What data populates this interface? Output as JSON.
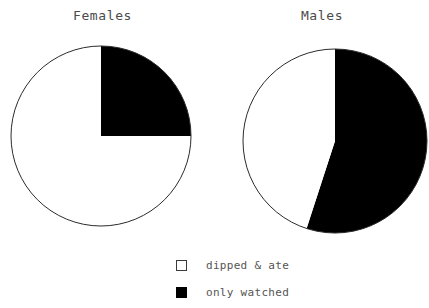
{
  "chart_data": [
    {
      "type": "pie",
      "title": "Females",
      "categories": [
        "dipped & ate",
        "only watched"
      ],
      "values": [
        75,
        25
      ],
      "colors": [
        "#ffffff",
        "#000000"
      ],
      "start_angle_deg": 0,
      "direction": "clockwise",
      "units": "percent",
      "grid": false,
      "legend_position": "bottom-center",
      "center": [
        101,
        136
      ],
      "radius": 90
    },
    {
      "type": "pie",
      "title": "Males",
      "categories": [
        "dipped & ate",
        "only watched"
      ],
      "values": [
        45,
        55
      ],
      "colors": [
        "#ffffff",
        "#000000"
      ],
      "start_angle_deg": 0,
      "direction": "clockwise",
      "units": "percent",
      "grid": false,
      "legend_position": "bottom-center",
      "center": [
        335,
        141
      ],
      "radius": 92
    }
  ],
  "charts": [
    {
      "title": "Females"
    },
    {
      "title": "Males"
    }
  ],
  "legend": {
    "items": [
      {
        "label": "dipped & ate",
        "swatch": "white-square-icon"
      },
      {
        "label": "only watched",
        "swatch": "black-square-icon"
      }
    ]
  },
  "style": {
    "outline_color": "#2b2b2b",
    "black_fill": "#000000",
    "white_fill": "#ffffff",
    "text_color": "#4a4a4a",
    "background": "#ffffff"
  }
}
